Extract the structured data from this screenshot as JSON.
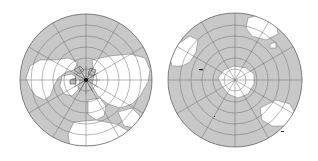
{
  "figure": {
    "maps": [
      {
        "id": "north",
        "label": "Northern hemisphere polar projection",
        "center": [
          86,
          80
        ],
        "radius": 66,
        "ocean_color": "#c8c8c8",
        "land_color": "#ffffff",
        "grid_color": "#6e6e6e",
        "outline_color": "#3a3a3a"
      },
      {
        "id": "south",
        "label": "Southern hemisphere polar projection",
        "center": [
          235,
          80
        ],
        "radius": 67,
        "ocean_color": "#c8c8c8",
        "land_color": "#ffffff",
        "grid_color": "#6e6e6e",
        "outline_color": "#3a3a3a"
      }
    ],
    "graticule": {
      "meridian_step_deg": 30,
      "parallel_rings": 6
    }
  }
}
